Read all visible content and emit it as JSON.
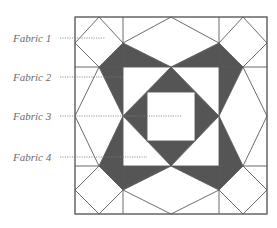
{
  "colors": {
    "dark_fabric": "#555555",
    "light_fabric": "#ffffff",
    "line": "#5a5a5a",
    "label_text": "#6a6a6a"
  },
  "block": {
    "outer": {
      "x1": 75,
      "y1": 17,
      "x2": 267,
      "y2": 214
    },
    "grid_x": [
      123,
      219
    ],
    "grid_y": [
      67,
      166
    ],
    "center": [
      171,
      116
    ],
    "inner_square": {
      "x": 147,
      "y": 92,
      "w": 48,
      "h": 49
    }
  },
  "labels": [
    {
      "text": "Fabric 1",
      "y": 38,
      "leader_end_x": 105
    },
    {
      "text": "Fabric 2",
      "y": 77,
      "leader_end_x": 123
    },
    {
      "text": "Fabric 3",
      "y": 116,
      "leader_end_x": 182
    },
    {
      "text": "Fabric 4",
      "y": 157,
      "leader_end_x": 147
    }
  ]
}
